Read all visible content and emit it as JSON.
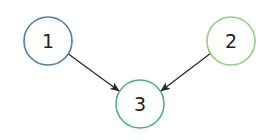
{
  "diagram": {
    "type": "directed-graph",
    "nodes": [
      {
        "id": "1",
        "label": "1",
        "cx": 48,
        "cy": 41,
        "r": 24,
        "stroke": "#4a7fa8"
      },
      {
        "id": "2",
        "label": "2",
        "cx": 231,
        "cy": 41,
        "r": 24,
        "stroke": "#93cf7c"
      },
      {
        "id": "3",
        "label": "3",
        "cx": 140,
        "cy": 104,
        "r": 24,
        "stroke": "#4fae92"
      }
    ],
    "edges": [
      {
        "from": "1",
        "to": "3"
      },
      {
        "from": "2",
        "to": "3"
      }
    ],
    "arrow_color": "#2a2a2a"
  }
}
